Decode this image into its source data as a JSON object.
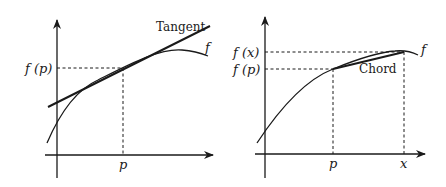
{
  "left_panel": {
    "tangent_label": "Tangent",
    "function_label": "f",
    "y_tick_label": "f (p)",
    "x_tick_label": "p"
  },
  "right_panel": {
    "chord_label": "Chord",
    "function_label": "f",
    "y_tick_labels": [
      "f (x)",
      "f (p)"
    ],
    "x_tick_labels": [
      "p",
      "x"
    ]
  },
  "colors": {
    "ink": "#1a1a1a",
    "background": "#ffffff"
  }
}
